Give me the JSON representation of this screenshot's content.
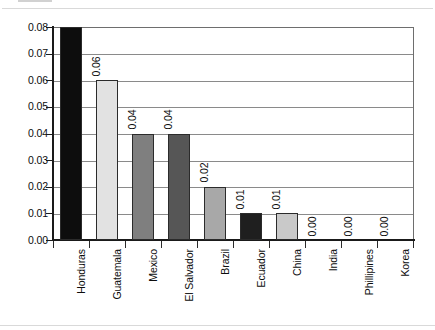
{
  "chart_data": {
    "type": "bar",
    "title": "",
    "subtitle": "",
    "xlabel": "",
    "ylabel": "",
    "ylim": [
      0,
      0.08
    ],
    "ytick_labels": [
      "0.08",
      "0.07",
      "0.06",
      "0.05",
      "0.04",
      "0.03",
      "0.02",
      "0.01",
      "0.00"
    ],
    "ytick_values": [
      0.08,
      0.07,
      0.06,
      0.05,
      0.04,
      0.03,
      0.02,
      0.01,
      0.0
    ],
    "grid": true,
    "legend": "none",
    "orientation": "vertical",
    "value_label_rotation": "90",
    "category_label_rotation": "90",
    "categories": [
      "Honduras",
      "Guatemala",
      "Mexico",
      "El Salvador",
      "Brazil",
      "Ecuador",
      "China",
      "India",
      "Phillipines",
      "Korea"
    ],
    "values": [
      0.08,
      0.06,
      0.04,
      0.04,
      0.02,
      0.01,
      0.01,
      0.0,
      0.0,
      0.0
    ],
    "value_labels": [
      "0.08",
      "0.06",
      "0.04",
      "0.04",
      "0.02",
      "0.01",
      "0.01",
      "0.00",
      "0.00",
      "0.00"
    ],
    "bar_colors": [
      "#0d0d0d",
      "#e2e2e2",
      "#7f7f7f",
      "#565656",
      "#a8a8a8",
      "#1f1f1f",
      "#c9c9c9",
      "#ffffff",
      "#ffffff",
      "#ffffff"
    ],
    "bars": [
      {
        "label": "Honduras",
        "value": 0.08,
        "value_label": "0.08",
        "color": "#0d0d0d",
        "show_value_label": false
      },
      {
        "label": "Guatemala",
        "value": 0.06,
        "value_label": "0.06",
        "color": "#e2e2e2",
        "show_value_label": true
      },
      {
        "label": "Mexico",
        "value": 0.04,
        "value_label": "0.04",
        "color": "#7f7f7f",
        "show_value_label": true
      },
      {
        "label": "El Salvador",
        "value": 0.04,
        "value_label": "0.04",
        "color": "#565656",
        "show_value_label": true
      },
      {
        "label": "Brazil",
        "value": 0.02,
        "value_label": "0.02",
        "color": "#a8a8a8",
        "show_value_label": true
      },
      {
        "label": "Ecuador",
        "value": 0.01,
        "value_label": "0.01",
        "color": "#1f1f1f",
        "show_value_label": true
      },
      {
        "label": "China",
        "value": 0.01,
        "value_label": "0.01",
        "color": "#c9c9c9",
        "show_value_label": true
      },
      {
        "label": "India",
        "value": 0.0,
        "value_label": "0.00",
        "color": "#ffffff",
        "show_value_label": true
      },
      {
        "label": "Phillipines",
        "value": 0.0,
        "value_label": "0.00",
        "color": "#ffffff",
        "show_value_label": true
      },
      {
        "label": "Korea",
        "value": 0.0,
        "value_label": "0.00",
        "color": "#ffffff",
        "show_value_label": true
      }
    ],
    "axis_color": "#1a1a1a",
    "gridline_color": "#8a8a8a",
    "plot_background": "#ffffff"
  }
}
